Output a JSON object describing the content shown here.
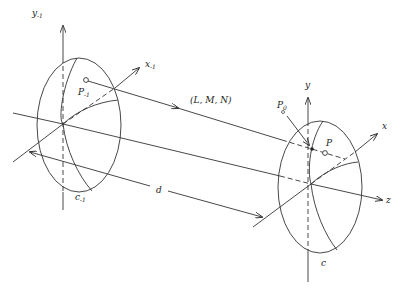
{
  "figure": {
    "left_frame": {
      "y_axis_label": "y",
      "y_axis_sub": "-1",
      "x_axis_label": "x",
      "x_axis_sub": "-1",
      "point_label": "P",
      "point_sub": "-1",
      "surface_label": "c",
      "surface_sub": "-1"
    },
    "right_frame": {
      "y_axis_label": "y",
      "x_axis_label": "x",
      "z_axis_label": "z",
      "point_label": "P",
      "intercept_label": "P",
      "intercept_sub": "0",
      "surface_label": "c"
    },
    "ray_label": "(L, M, N)",
    "distance_label": "d"
  }
}
